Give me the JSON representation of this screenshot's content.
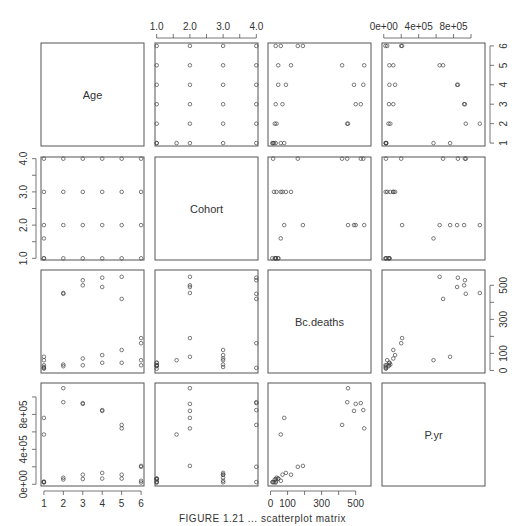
{
  "chart_data": {
    "type": "scatter",
    "subtype": "scatterplot-matrix",
    "variables": [
      "Age",
      "Cohort",
      "Bc.deaths",
      "P.yr"
    ],
    "title": "",
    "caption": "FIGURE 1.21 ... scatterplot matrix",
    "axes": {
      "Age": {
        "range": [
          0.85,
          6.15
        ],
        "ticks": [
          1,
          2,
          3,
          4,
          5,
          6
        ],
        "tick_labels": [
          "1",
          "2",
          "3",
          "4",
          "5",
          "6"
        ],
        "minor": []
      },
      "Cohort": {
        "range": [
          0.95,
          4.05
        ],
        "ticks": [
          1.0,
          1.5,
          2.0,
          2.5,
          3.0,
          3.5,
          4.0
        ],
        "tick_labels": [
          "1.0",
          "",
          "2.0",
          "",
          "3.0",
          "",
          "4.0"
        ]
      },
      "Bc.deaths": {
        "range": [
          -15,
          590
        ],
        "ticks": [
          0,
          100,
          200,
          300,
          400,
          500
        ],
        "tick_labels": [
          "0",
          "100",
          "",
          "300",
          "",
          "500"
        ]
      },
      "P.yr": {
        "range": [
          -20000,
          1160000
        ],
        "ticks": [
          0,
          200000,
          400000,
          600000,
          800000,
          1000000
        ],
        "tick_labels": [
          "0e+00",
          "",
          "4e+05",
          "",
          "8e+05",
          ""
        ]
      }
    },
    "axis_placement": {
      "top": [
        "Cohort",
        "P.yr"
      ],
      "bottom": [
        "Age",
        "Bc.deaths"
      ],
      "left": [
        "Cohort",
        "P.yr"
      ],
      "right": [
        "Age",
        "Bc.deaths"
      ]
    },
    "points": [
      {
        "Age": 1,
        "Cohort": 1,
        "Bc.deaths": 10,
        "P.yr": 25000
      },
      {
        "Age": 1,
        "Cohort": 1,
        "Bc.deaths": 30,
        "P.yr": 30000
      },
      {
        "Age": 1,
        "Cohort": 1.6,
        "Bc.deaths": 60,
        "P.yr": 570000
      },
      {
        "Age": 1,
        "Cohort": 2,
        "Bc.deaths": 80,
        "P.yr": 760000
      },
      {
        "Age": 1,
        "Cohort": 3,
        "Bc.deaths": 20,
        "P.yr": 22000
      },
      {
        "Age": 1,
        "Cohort": 4,
        "Bc.deaths": 15,
        "P.yr": 25000
      },
      {
        "Age": 2,
        "Cohort": 1,
        "Bc.deaths": 25,
        "P.yr": 55000
      },
      {
        "Age": 2,
        "Cohort": 2,
        "Bc.deaths": 455,
        "P.yr": 1100000
      },
      {
        "Age": 2,
        "Cohort": 3,
        "Bc.deaths": 35,
        "P.yr": 75000
      },
      {
        "Age": 2,
        "Cohort": 4,
        "Bc.deaths": 450,
        "P.yr": 940000
      },
      {
        "Age": 3,
        "Cohort": 1,
        "Bc.deaths": 30,
        "P.yr": 60000
      },
      {
        "Age": 3,
        "Cohort": 2,
        "Bc.deaths": 500,
        "P.yr": 920000
      },
      {
        "Age": 3,
        "Cohort": 3,
        "Bc.deaths": 70,
        "P.yr": 110000
      },
      {
        "Age": 3,
        "Cohort": 4,
        "Bc.deaths": 530,
        "P.yr": 930000
      },
      {
        "Age": 4,
        "Cohort": 1,
        "Bc.deaths": 45,
        "P.yr": 65000
      },
      {
        "Age": 4,
        "Cohort": 2,
        "Bc.deaths": 490,
        "P.yr": 840000
      },
      {
        "Age": 4,
        "Cohort": 3,
        "Bc.deaths": 90,
        "P.yr": 130000
      },
      {
        "Age": 4,
        "Cohort": 4,
        "Bc.deaths": 545,
        "P.yr": 850000
      },
      {
        "Age": 5,
        "Cohort": 1,
        "Bc.deaths": 45,
        "P.yr": 65000
      },
      {
        "Age": 5,
        "Cohort": 2,
        "Bc.deaths": 550,
        "P.yr": 640000
      },
      {
        "Age": 5,
        "Cohort": 3,
        "Bc.deaths": 120,
        "P.yr": 110000
      },
      {
        "Age": 5,
        "Cohort": 4,
        "Bc.deaths": 420,
        "P.yr": 680000
      },
      {
        "Age": 6,
        "Cohort": 1,
        "Bc.deaths": 30,
        "P.yr": 20000
      },
      {
        "Age": 6,
        "Cohort": 2,
        "Bc.deaths": 190,
        "P.yr": 210000
      },
      {
        "Age": 6,
        "Cohort": 3,
        "Bc.deaths": 60,
        "P.yr": 40000
      },
      {
        "Age": 6,
        "Cohort": 4,
        "Bc.deaths": 160,
        "P.yr": 200000
      }
    ],
    "grid": false,
    "legend": null
  },
  "style": {
    "axis_color": "#555555",
    "point_color": "#444444",
    "frame_color": "#555555",
    "text_color": "#333333"
  }
}
